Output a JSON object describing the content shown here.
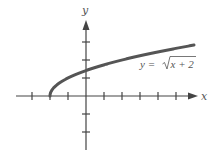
{
  "chart_data": {
    "type": "line",
    "title": "",
    "xlabel": "x",
    "ylabel": "y",
    "function": "y = sqrt(x + 2)",
    "series": [
      {
        "name": "y = √x + 2",
        "color": "#555555",
        "x": [
          -2,
          -1.75,
          -1.5,
          -1,
          -0.5,
          0,
          1,
          2,
          3,
          4,
          5,
          6
        ],
        "y": [
          0,
          0.5,
          0.707,
          1,
          1.225,
          1.414,
          1.732,
          2,
          2.236,
          2.449,
          2.646,
          2.828
        ]
      }
    ],
    "xlim": [
      -3.8,
      6.3
    ],
    "ylim": [
      -3,
      4
    ],
    "x_ticks": [
      -3,
      -2,
      -1,
      1,
      2,
      3,
      4,
      5
    ],
    "y_ticks": [
      -2,
      -1,
      1,
      2,
      3
    ],
    "tick_labels_shown": false,
    "grid": false,
    "legend": "none",
    "annotations": [
      {
        "text_lhs": "y = ",
        "radical": "√",
        "radicand": "x + 2",
        "position": "below curve, right side"
      }
    ]
  },
  "labels": {
    "x_axis": "x",
    "y_axis": "y",
    "eq_lhs": "y = ",
    "eq_radicand": "x + 2"
  },
  "colors": {
    "axis": "#444444",
    "curve": "#555555",
    "text": "#555555"
  }
}
